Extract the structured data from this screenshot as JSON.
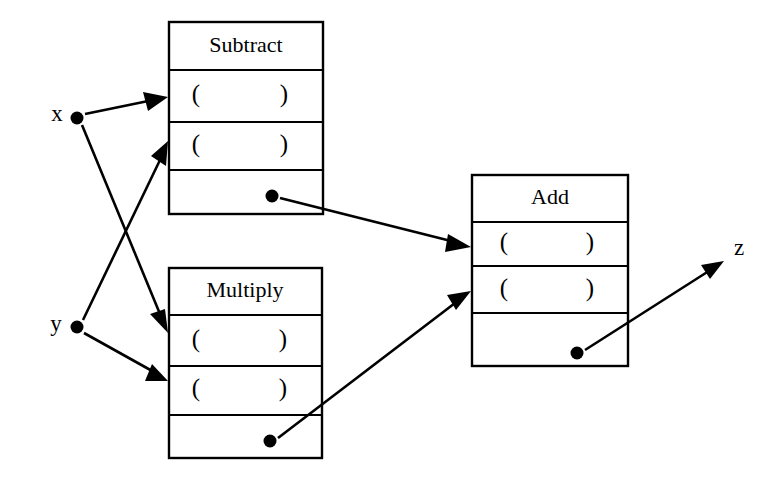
{
  "diagram": {
    "type": "dataflow-block-diagram",
    "colors": {
      "background": "#ffffff",
      "stroke": "#000000",
      "fill": "#ffffff"
    },
    "terminals": [
      {
        "id": "x",
        "label": "x",
        "role": "input",
        "label_x": 57,
        "label_y": 116,
        "dot_x": 77,
        "dot_y": 118,
        "dot_r": 6.5
      },
      {
        "id": "y",
        "label": "y",
        "role": "input",
        "label_x": 56,
        "label_y": 326,
        "dot_x": 77,
        "dot_y": 327,
        "dot_r": 6.5
      },
      {
        "id": "z",
        "label": "z",
        "role": "output",
        "label_x": 739,
        "label_y": 250,
        "dot_x": null,
        "dot_y": null,
        "dot_r": 0
      }
    ],
    "nodes": [
      {
        "id": "subtract",
        "title": "Subtract",
        "x": 169,
        "y": 22,
        "width": 154,
        "height": 192,
        "title_row_bottom": 70,
        "rows": [
          {
            "id": "subtract-arg-1",
            "label_open": "(",
            "label_close": ")",
            "top": 70,
            "bottom": 122,
            "kind": "argument"
          },
          {
            "id": "subtract-arg-2",
            "label_open": "(",
            "label_close": ")",
            "top": 122,
            "bottom": 170,
            "kind": "argument"
          }
        ],
        "result_row": {
          "id": "subtract-result",
          "top": 170,
          "bottom": 214,
          "kind": "result",
          "dot_x": 272,
          "dot_y": 196,
          "dot_r": 6.5
        }
      },
      {
        "id": "multiply",
        "title": "Multiply",
        "x": 169,
        "y": 268,
        "width": 153,
        "height": 190,
        "title_row_bottom": 315,
        "rows": [
          {
            "id": "multiply-arg-1",
            "label_open": "(",
            "label_close": ")",
            "top": 315,
            "bottom": 366,
            "kind": "argument"
          },
          {
            "id": "multiply-arg-2",
            "label_open": "(",
            "label_close": ")",
            "top": 366,
            "bottom": 415,
            "kind": "argument"
          }
        ],
        "result_row": {
          "id": "multiply-result",
          "top": 415,
          "bottom": 458,
          "kind": "result",
          "dot_x": 270,
          "dot_y": 441,
          "dot_r": 6.5
        }
      },
      {
        "id": "add",
        "title": "Add",
        "x": 472,
        "y": 175,
        "width": 156,
        "height": 191,
        "title_row_bottom": 222,
        "rows": [
          {
            "id": "add-arg-1",
            "label_open": "(",
            "label_close": ")",
            "top": 222,
            "bottom": 266,
            "kind": "argument"
          },
          {
            "id": "add-arg-2",
            "label_open": "(",
            "label_close": ")",
            "top": 266,
            "bottom": 313,
            "kind": "argument"
          }
        ],
        "result_row": {
          "id": "add-result",
          "top": 313,
          "bottom": 366,
          "kind": "result",
          "dot_x": 577,
          "dot_y": 353,
          "dot_r": 6.5
        }
      }
    ],
    "edges": [
      {
        "id": "edge-x-to-subtract-arg1",
        "from": "x",
        "to": "subtract-arg-1",
        "x1": 85,
        "y1": 114,
        "x2": 168,
        "y2": 97
      },
      {
        "id": "edge-x-to-multiply-arg1",
        "from": "x",
        "to": "multiply-arg-1",
        "x1": 82,
        "y1": 125,
        "x2": 168,
        "y2": 333
      },
      {
        "id": "edge-y-to-subtract-arg2",
        "from": "y",
        "to": "subtract-arg-2",
        "x1": 83,
        "y1": 320,
        "x2": 168,
        "y2": 141
      },
      {
        "id": "edge-y-to-multiply-arg2",
        "from": "y",
        "to": "multiply-arg-2",
        "x1": 84,
        "y1": 333,
        "x2": 168,
        "y2": 381
      },
      {
        "id": "edge-subtract-result-to-add-arg1",
        "from": "subtract-result",
        "to": "add-arg-1",
        "x1": 280,
        "y1": 198,
        "x2": 471,
        "y2": 247
      },
      {
        "id": "edge-multiply-result-to-add-arg2",
        "from": "multiply-result",
        "to": "add-arg-2",
        "x1": 278,
        "y1": 438,
        "x2": 471,
        "y2": 291
      },
      {
        "id": "edge-add-result-to-z",
        "from": "add-result",
        "to": "z",
        "x1": 585,
        "y1": 350,
        "x2": 724,
        "y2": 261
      }
    ]
  }
}
